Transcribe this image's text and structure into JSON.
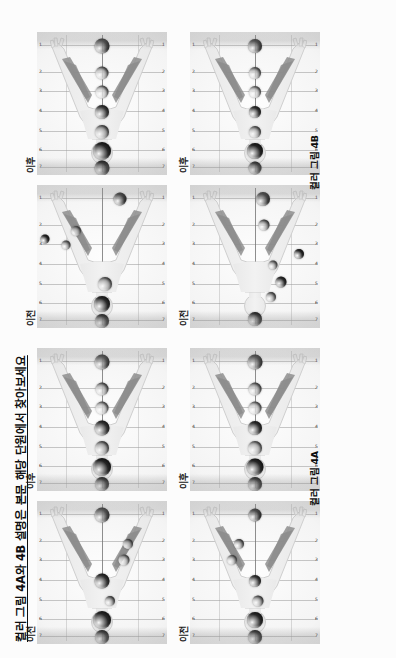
{
  "document": {
    "title": "컬러 그림 4A와 4B 설명은 본문 해당 단원에서 찾아보세요"
  },
  "captions": {
    "group_a": "컬러 그림 4A",
    "group_b": "컬러 그림 4B"
  },
  "labels": {
    "before": "이전",
    "after": "이후"
  },
  "axis": {
    "top_ticks": [
      "7",
      "6",
      "5",
      "4",
      "3",
      "2",
      "1"
    ],
    "bottom_ticks": [
      "7",
      "6",
      "5",
      "4",
      "3",
      "2",
      "1"
    ]
  },
  "chart_data": {
    "type": "scatter",
    "title": "컬러 그림 4A와 4B 설명은 본문 해당 단원에서 찾아보세요",
    "xlabel": "",
    "ylabel": "",
    "grid": true,
    "legend": "none",
    "panels": [
      {
        "id": "a1-before",
        "group": "컬러 그림 4A",
        "label": "이전",
        "row": 1,
        "points": [
          {
            "name": "crown",
            "x": 5,
            "y": 50,
            "r": 7.0,
            "color": "#3b3b3b"
          },
          {
            "name": "third-eye",
            "x": 17,
            "y": 50,
            "r": 9.0,
            "color": "#2a2a2a"
          },
          {
            "name": "throat",
            "x": 30,
            "y": 56,
            "r": 5.0,
            "color": "#9a9a9a"
          },
          {
            "name": "heart",
            "x": 44,
            "y": 50,
            "r": 7.5,
            "color": "#3c3c3c"
          },
          {
            "name": "solar-plexus",
            "x": 59,
            "y": 67,
            "r": 5.5,
            "color": "#b4b4b4"
          },
          {
            "name": "sacral",
            "x": 70,
            "y": 70,
            "r": 5.0,
            "color": "#9d9d9d"
          },
          {
            "name": "root",
            "x": 90,
            "y": 50,
            "r": 7.5,
            "color": "#4a4a4a"
          }
        ]
      },
      {
        "id": "a1-after",
        "group": "컬러 그림 4A",
        "label": "이후",
        "row": 1,
        "points": [
          {
            "name": "crown",
            "x": 5,
            "y": 50,
            "r": 7.0,
            "color": "#3a3a3a"
          },
          {
            "name": "third-eye",
            "x": 17,
            "y": 50,
            "r": 9.0,
            "color": "#272727"
          },
          {
            "name": "throat",
            "x": 30,
            "y": 50,
            "r": 7.0,
            "color": "#9e9e9e"
          },
          {
            "name": "heart",
            "x": 44,
            "y": 50,
            "r": 7.5,
            "color": "#3c3c3c"
          },
          {
            "name": "solar-plexus",
            "x": 58,
            "y": 50,
            "r": 6.5,
            "color": "#c2c2c2"
          },
          {
            "name": "sacral",
            "x": 71,
            "y": 50,
            "r": 6.5,
            "color": "#a8a8a8"
          },
          {
            "name": "root",
            "x": 90,
            "y": 50,
            "r": 7.5,
            "color": "#4a4a4a"
          }
        ]
      },
      {
        "id": "a2-before",
        "group": "컬러 그림 4A",
        "label": "이전",
        "row": 2,
        "points": [
          {
            "name": "crown",
            "x": 5,
            "y": 50,
            "r": 7.0,
            "color": "#3f3f3f"
          },
          {
            "name": "third-eye",
            "x": 17,
            "y": 50,
            "r": 8.0,
            "color": "#2e2e2e"
          },
          {
            "name": "throat",
            "x": 30,
            "y": 52,
            "r": 5.5,
            "color": "#9e9e9e"
          },
          {
            "name": "heart",
            "x": 44,
            "y": 50,
            "r": 6.0,
            "color": "#4a4a4a"
          },
          {
            "name": "solar-plexus",
            "x": 59,
            "y": 32,
            "r": 5.0,
            "color": "#b2b2b2"
          },
          {
            "name": "sacral",
            "x": 70,
            "y": 38,
            "r": 5.0,
            "color": "#9a9a9a"
          },
          {
            "name": "root",
            "x": 90,
            "y": 50,
            "r": 6.5,
            "color": "#3e3e3e"
          }
        ]
      },
      {
        "id": "a2-after",
        "group": "컬러 그림 4A",
        "label": "이후",
        "row": 2,
        "points": [
          {
            "name": "crown",
            "x": 5,
            "y": 50,
            "r": 7.0,
            "color": "#3c3c3c"
          },
          {
            "name": "third-eye",
            "x": 17,
            "y": 50,
            "r": 8.5,
            "color": "#2a2a2a"
          },
          {
            "name": "throat",
            "x": 30,
            "y": 50,
            "r": 7.0,
            "color": "#aeaeae"
          },
          {
            "name": "heart",
            "x": 44,
            "y": 50,
            "r": 7.0,
            "color": "#3a3a3a"
          },
          {
            "name": "solar-plexus",
            "x": 58,
            "y": 50,
            "r": 6.5,
            "color": "#c0c0c0"
          },
          {
            "name": "sacral",
            "x": 71,
            "y": 50,
            "r": 6.5,
            "color": "#a6a6a6"
          },
          {
            "name": "root",
            "x": 90,
            "y": 50,
            "r": 7.5,
            "color": "#4a4a4a"
          }
        ]
      },
      {
        "id": "b1-before",
        "group": "컬러 그림 4B",
        "label": "이전",
        "row": 1,
        "points": [
          {
            "name": "crown",
            "x": 5,
            "y": 50,
            "r": 7.0,
            "color": "#3c3c3c"
          },
          {
            "name": "third-eye",
            "x": 17,
            "y": 50,
            "r": 8.0,
            "color": "#2f2f2f"
          },
          {
            "name": "throat",
            "x": 31,
            "y": 52,
            "r": 7.0,
            "color": "#a2a2a2"
          },
          {
            "name": "solar-plexus",
            "x": 58,
            "y": 22,
            "r": 4.5,
            "color": "#9f9f9f"
          },
          {
            "name": "sacral",
            "x": 68,
            "y": 30,
            "r": 5.0,
            "color": "#a8a8a8"
          },
          {
            "name": "extra-high",
            "x": 62,
            "y": 6,
            "r": 4.5,
            "color": "#303030"
          },
          {
            "name": "root",
            "x": 90,
            "y": 64,
            "r": 6.5,
            "color": "#3c3c3c"
          }
        ]
      },
      {
        "id": "b1-after",
        "group": "컬러 그림 4B",
        "label": "이후",
        "row": 1,
        "points": [
          {
            "name": "crown",
            "x": 5,
            "y": 50,
            "r": 7.5,
            "color": "#2e2e2e"
          },
          {
            "name": "third-eye",
            "x": 17,
            "y": 50,
            "r": 9.0,
            "color": "#2b2b2b"
          },
          {
            "name": "throat",
            "x": 30,
            "y": 50,
            "r": 7.0,
            "color": "#9d9d9d"
          },
          {
            "name": "heart",
            "x": 44,
            "y": 50,
            "r": 7.0,
            "color": "#4a4a4a"
          },
          {
            "name": "solar-plexus",
            "x": 58,
            "y": 50,
            "r": 6.5,
            "color": "#c6c6c6"
          },
          {
            "name": "sacral",
            "x": 71,
            "y": 50,
            "r": 6.5,
            "color": "#aeaeae"
          },
          {
            "name": "root",
            "x": 90,
            "y": 50,
            "r": 7.5,
            "color": "#444444"
          }
        ]
      },
      {
        "id": "b2-before",
        "group": "컬러 그림 4B",
        "label": "이전",
        "row": 2,
        "points": [
          {
            "name": "crown",
            "x": 6,
            "y": 50,
            "r": 7.0,
            "color": "#3a3a3a"
          },
          {
            "name": "third-eye",
            "x": 22,
            "y": 62,
            "r": 5.0,
            "color": "#9e9e9e"
          },
          {
            "name": "throat",
            "x": 32,
            "y": 70,
            "r": 5.5,
            "color": "#3a3a3a"
          },
          {
            "name": "heart",
            "x": 44,
            "y": 64,
            "r": 4.5,
            "color": "#a9a9a9"
          },
          {
            "name": "solar-plexus",
            "x": 52,
            "y": 84,
            "r": 5.0,
            "color": "#303030"
          },
          {
            "name": "sacral",
            "x": 72,
            "y": 57,
            "r": 5.5,
            "color": "#9a9a9a"
          },
          {
            "name": "root",
            "x": 90,
            "y": 56,
            "r": 7.0,
            "color": "#3e3e3e"
          }
        ]
      },
      {
        "id": "b2-after",
        "group": "컬러 그림 4B",
        "label": "이후",
        "row": 2,
        "points": [
          {
            "name": "crown",
            "x": 5,
            "y": 50,
            "r": 6.5,
            "color": "#3c3c3c"
          },
          {
            "name": "third-eye",
            "x": 17,
            "y": 50,
            "r": 8.0,
            "color": "#272727"
          },
          {
            "name": "throat",
            "x": 30,
            "y": 50,
            "r": 6.0,
            "color": "#a4a4a4"
          },
          {
            "name": "heart",
            "x": 44,
            "y": 50,
            "r": 6.0,
            "color": "#3f3f3f"
          },
          {
            "name": "solar-plexus",
            "x": 58,
            "y": 50,
            "r": 6.0,
            "color": "#c4c4c4"
          },
          {
            "name": "sacral",
            "x": 71,
            "y": 50,
            "r": 6.0,
            "color": "#ababab"
          },
          {
            "name": "root",
            "x": 90,
            "y": 50,
            "r": 7.0,
            "color": "#484848"
          }
        ]
      }
    ]
  }
}
